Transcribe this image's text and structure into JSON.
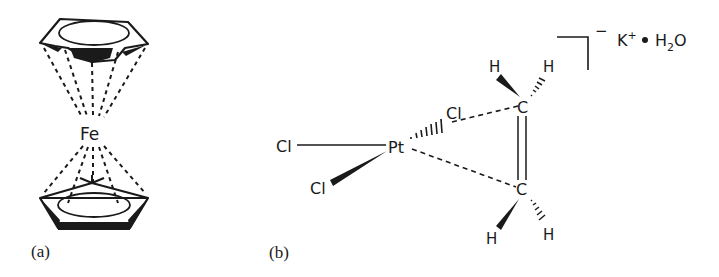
{
  "figure": {
    "panel_a": {
      "caption": "(a)",
      "name": "ferrocene",
      "metal": "Fe"
    },
    "panel_b": {
      "caption": "(b)",
      "name": "Zeise's salt anion",
      "metal": "Pt",
      "ligands": {
        "cl_left": "Cl",
        "cl_wedge": "Cl",
        "cl_hashed": "Cl",
        "c_top": "C",
        "c_bottom": "C",
        "h_top_left": "H",
        "h_top_right": "H",
        "h_bottom_left": "H",
        "h_bottom_right": "H"
      },
      "charge": "−",
      "counterion": "K",
      "counterion_charge": "+",
      "dot": "•",
      "water_h": "H",
      "water_sub": "2",
      "water_o": "O"
    }
  }
}
